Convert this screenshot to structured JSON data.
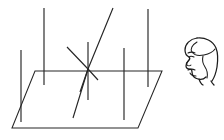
{
  "figure": {
    "background_color": "#ffffff",
    "line_color": "#262626",
    "head_line_color": "#1c1c1c",
    "width": 224,
    "height": 140
  },
  "plane": {
    "name": "ground-plane-parallelogram",
    "description": "Parallelogram drawn in perspective representing a horizontal plane",
    "corners": [
      {
        "label": "top-left",
        "x": 35,
        "y": 71
      },
      {
        "label": "top-right",
        "x": 162,
        "y": 71
      },
      {
        "label": "bottom-right",
        "x": 138,
        "y": 128
      },
      {
        "label": "bottom-left",
        "x": 12,
        "y": 128
      }
    ],
    "path": "M 35 71 L 162 71 L 138 128 L 12 128 Z"
  },
  "vertical_lines": [
    {
      "name": "vertical-line-1",
      "x_top": 21,
      "y_top": 50,
      "x_bottom": 21,
      "y_bottom": 122
    },
    {
      "name": "vertical-line-2",
      "x_top": 44,
      "y_top": 8,
      "x_bottom": 44,
      "y_bottom": 85
    },
    {
      "name": "vertical-line-3",
      "x_top": 88,
      "y_top": 42,
      "x_bottom": 88,
      "y_bottom": 100
    },
    {
      "name": "vertical-line-4",
      "x_top": 124,
      "y_top": 48,
      "x_bottom": 124,
      "y_bottom": 120
    },
    {
      "name": "vertical-line-5",
      "x_top": 148,
      "y_top": 9,
      "x_bottom": 148,
      "y_bottom": 87
    }
  ],
  "convergence_node": {
    "name": "intersection-node",
    "x": 88,
    "y": 69
  },
  "rays": [
    {
      "name": "steep-diagonal-ray",
      "description": "Steep line descending from upper right through the node and continuing below",
      "path": "M 113 8 L 88 69 L 80 92"
    },
    {
      "name": "shallow-diagonal-ray",
      "description": "Shallow line from upper left through the node to lower right",
      "path": "M 67 47 L 88 69 L 98 80"
    },
    {
      "name": "curved-descending-ray",
      "description": "Gently curved line from the node descending to the lower left of the plane",
      "path": "M 88 69 C 83 85, 78 102, 73 118"
    }
  ],
  "observer_head": {
    "name": "observer-head-profile",
    "description": "Human head drawn in left-facing profile",
    "facing": "left",
    "bounds": {
      "x": 183,
      "y": 37,
      "width": 36,
      "height": 47
    },
    "parts": [
      "skull-outline",
      "hairline",
      "forehead",
      "brow",
      "eye",
      "nose",
      "lips",
      "chin",
      "jaw",
      "ear-region",
      "neck"
    ]
  }
}
